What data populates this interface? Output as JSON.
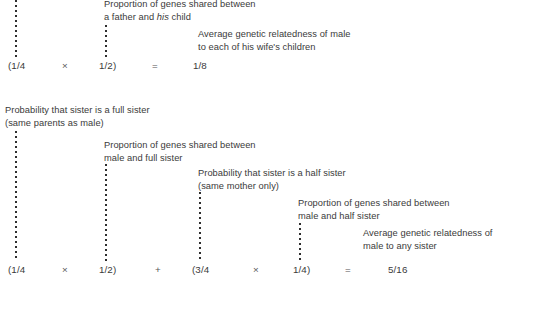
{
  "figure": {
    "type": "annotated-equation-diagram",
    "background_color": "#ffffff",
    "text_color": "#3a3a3a"
  },
  "blocks": [
    {
      "id": "father-child-block",
      "captions": [
        {
          "id": "proportion-father-child",
          "line1_pre": "Proportion of genes shared between",
          "line2_pre": "a father and ",
          "line2_em": "his",
          "line2_post": " child"
        },
        {
          "id": "average-relatedness-wife-children",
          "line1": "Average genetic relatedness of male",
          "line2": "to each of his wife's children"
        }
      ],
      "equation": {
        "id": "equation-father-child",
        "tokens": [
          {
            "id": "term-1-4-open",
            "text": "(1/4"
          },
          {
            "id": "op-times-1",
            "text": "×"
          },
          {
            "id": "term-1-2-close",
            "text": "1/2)"
          },
          {
            "id": "op-equals-1",
            "text": "="
          },
          {
            "id": "result-1-8",
            "text": "1/8"
          }
        ]
      }
    },
    {
      "id": "sister-relatedness-block",
      "captions": [
        {
          "id": "probability-full-sister",
          "line1": "Probability that sister is a full sister",
          "line2": "(same parents as male)"
        },
        {
          "id": "proportion-male-full-sister",
          "line1": "Proportion of genes shared between",
          "line2": "male and full sister"
        },
        {
          "id": "probability-half-sister",
          "line1": "Probability that sister is a half sister",
          "line2": "(same mother only)"
        },
        {
          "id": "proportion-male-half-sister",
          "line1": "Proportion of genes shared between",
          "line2": "male and half sister"
        },
        {
          "id": "average-relatedness-any-sister",
          "line1": "Average genetic relatedness of",
          "line2": "male to any sister"
        }
      ],
      "equation": {
        "id": "equation-any-sister",
        "tokens": [
          {
            "id": "term-1-4-open-b",
            "text": "(1/4"
          },
          {
            "id": "op-times-2",
            "text": "×"
          },
          {
            "id": "term-1-2-close-b",
            "text": "1/2)"
          },
          {
            "id": "op-plus-1",
            "text": "+"
          },
          {
            "id": "term-3-4-open",
            "text": "(3/4"
          },
          {
            "id": "op-times-3",
            "text": "×"
          },
          {
            "id": "term-1-4-close",
            "text": "1/4)"
          },
          {
            "id": "op-equals-2",
            "text": "="
          },
          {
            "id": "result-5-16",
            "text": "5/16"
          }
        ]
      }
    }
  ]
}
